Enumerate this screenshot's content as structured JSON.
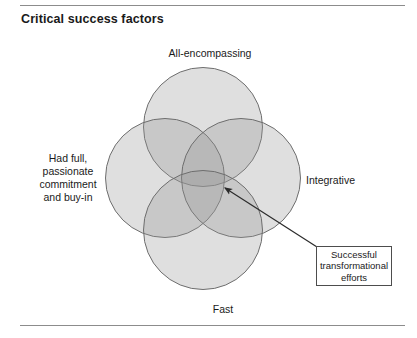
{
  "page": {
    "title": "Critical success factors"
  },
  "diagram": {
    "type": "venn",
    "set_count": 4,
    "circles": [
      {
        "id": "top",
        "label": "All-encompassing"
      },
      {
        "id": "left",
        "label": "Had full,\npassionate\ncommitment\nand buy-in"
      },
      {
        "id": "right",
        "label": "Integrative"
      },
      {
        "id": "bottom",
        "label": "Fast"
      }
    ],
    "labels": {
      "top": "All-encompassing",
      "left_line1": "Had full,",
      "left_line2": "passionate",
      "left_line3": "commitment",
      "left_line4": "and buy-in",
      "right": "Integrative",
      "bottom": "Fast"
    },
    "callout": {
      "line1": "Successful",
      "line2": "transformational",
      "line3": "efforts",
      "points_to": "center-intersection"
    },
    "colors": {
      "circle_fill": "#969696",
      "circle_stroke": "#6e6e6e",
      "callout_border": "#4d4d4d",
      "rule": "#8c8c8c",
      "text": "#1a1a1a",
      "background": "#ffffff"
    }
  }
}
